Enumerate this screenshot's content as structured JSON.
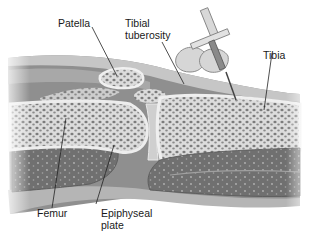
{
  "diagram": {
    "type": "anatomical-illustration",
    "colors": {
      "background": "#ffffff",
      "soft_tissue": "#8e8e8e",
      "skin": "#c8c8c8",
      "bone_spongy": "#d9d9d9",
      "bone_dots": "#7a7a7a",
      "medullary": "#6e6e6e",
      "label_text": "#1a1a1a"
    },
    "labels": {
      "patella": "Patella",
      "tibial_tuberosity_line1": "Tibial",
      "tibial_tuberosity_line2": "tuberosity",
      "tibia": "Tibia",
      "femur": "Femur",
      "epiphyseal_plate_line1": "Epiphyseal",
      "epiphyseal_plate_line2": "plate"
    }
  }
}
